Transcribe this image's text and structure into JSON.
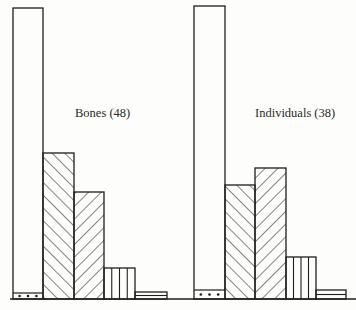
{
  "chart_data": {
    "type": "bar",
    "title": "",
    "xlabel": "",
    "ylabel": "",
    "grid": false,
    "legend": null,
    "categories": [
      "cat1 (dotted base)",
      "cat2 (/ hatch)",
      "cat3 (\\ hatch)",
      "cat4 (vertical lines)",
      "cat5 (horizontal lines)"
    ],
    "units": "relative bar height (px from baseline, approximate)",
    "series": [
      {
        "name": "Bones (48)",
        "label": "Bones (48)",
        "values": [
          291,
          146,
          107,
          31,
          7
        ],
        "dotted_segment": 6
      },
      {
        "name": "Individuals (38)",
        "label": "Individuals (38)",
        "values": [
          293,
          114,
          131,
          42,
          9
        ],
        "dotted_segment": 9
      }
    ],
    "patterns": [
      "open-with-dotted-base",
      "diagonal-forward",
      "diagonal-back",
      "vertical-lines",
      "horizontal-lines"
    ],
    "annotations": [
      "Bones (48)",
      "Individuals (38)"
    ]
  },
  "labels": {
    "bones": "Bones (48)",
    "individuals": "Individuals (38)"
  },
  "style": {
    "stroke": "#1e1e1e",
    "background": "#fdfdfb"
  }
}
